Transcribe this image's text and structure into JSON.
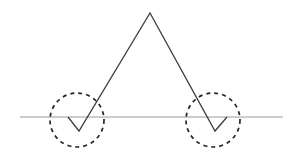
{
  "figure": {
    "background_color": "#ffffff",
    "width": 302,
    "height": 165
  },
  "chart_data": {
    "type": "line",
    "title": "",
    "subtitle": "",
    "xlabel": "",
    "ylabel": "",
    "xlim": [
      0,
      302
    ],
    "ylim": [
      165,
      0
    ],
    "grid": false,
    "legend": null,
    "axis": {
      "baseline_y": 117,
      "baseline_x_start": 20,
      "baseline_x_end": 283,
      "baseline_color": "#9a9a9a",
      "baseline_width": 1,
      "tick_labels": [],
      "ticks": []
    },
    "series": [
      {
        "name": "signal",
        "type": "polyline",
        "color": "#3c3c46",
        "width": 1.3,
        "x": [
          68,
          79,
          150,
          215,
          227
        ],
        "y": [
          117,
          131,
          13,
          131,
          117
        ],
        "points": [
          {
            "x": 68,
            "y": 117,
            "label": "start-on-baseline"
          },
          {
            "x": 79,
            "y": 131,
            "label": "left-trough"
          },
          {
            "x": 150,
            "y": 13,
            "label": "peak"
          },
          {
            "x": 215,
            "y": 131,
            "label": "right-trough"
          },
          {
            "x": 227,
            "y": 117,
            "label": "end-on-baseline"
          }
        ],
        "baseline_crossings": [
          {
            "x": 68,
            "y": 117
          },
          {
            "x": 93,
            "y": 117
          },
          {
            "x": 203,
            "y": 117
          },
          {
            "x": 227,
            "y": 117
          }
        ]
      }
    ],
    "annotations": [
      {
        "kind": "dashed-circle",
        "name": "left-dip-highlight",
        "cx": 77,
        "cy": 120,
        "r": 27,
        "color": "#262626",
        "width": 1.7,
        "dash": "4 4",
        "text": ""
      },
      {
        "kind": "dashed-circle",
        "name": "right-dip-highlight",
        "cx": 213,
        "cy": 120,
        "r": 27,
        "color": "#262626",
        "width": 1.7,
        "dash": "4 4",
        "text": ""
      }
    ],
    "colors": {
      "signal": "#3c3c46",
      "baseline": "#9a9a9a",
      "annotation": "#262626",
      "background": "#ffffff"
    }
  }
}
